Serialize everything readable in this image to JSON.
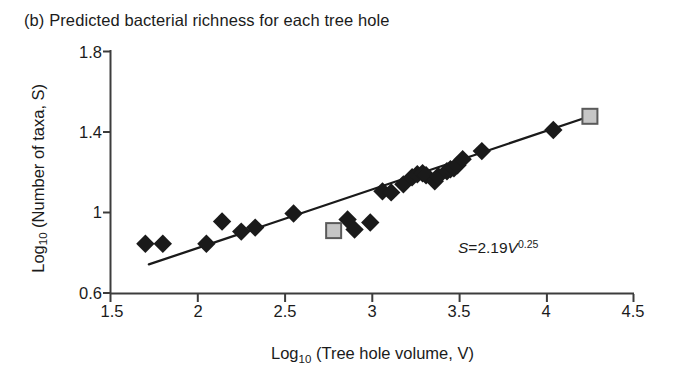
{
  "panel": {
    "label": "(b)",
    "title": "(b) Predicted bacterial richness for each tree hole"
  },
  "axes": {
    "y_title_main": "Log",
    "y_title_sub": "10",
    "y_title_rest": " (Number of taxa, S)",
    "x_title_main": "Log",
    "x_title_sub": "10",
    "x_title_rest": " (Tree hole volume, V)"
  },
  "annotation": {
    "eq_lhs": "S",
    "eq_eq": "=",
    "eq_coefficient": "2.19",
    "eq_var": "V",
    "eq_exponent": "0.25",
    "eq_full": "S = 2.19 V^0.25"
  },
  "colors": {
    "axis": "#3c3c3c",
    "text": "#1b1b1b",
    "diamond_fill": "#1a1a1a",
    "square_fill": "#c6c6c6",
    "square_stroke": "#5a5a5a",
    "trendline": "#1a1a1a",
    "background": "#ffffff"
  },
  "chart_data": {
    "type": "scatter",
    "title": "(b) Predicted bacterial richness for each tree hole",
    "xlabel": "Log10 (Tree hole volume, V)",
    "ylabel": "Log10 (Number of taxa, S)",
    "xlim": [
      1.5,
      4.5
    ],
    "ylim": [
      0.6,
      1.8
    ],
    "xticks": [
      "1.5",
      "2",
      "2.5",
      "3",
      "3.5",
      "4",
      "4.5"
    ],
    "xtick_values": [
      1.5,
      2,
      2.5,
      3,
      3.5,
      4,
      4.5
    ],
    "yticks": [
      "0.6",
      "1",
      "1.4",
      "1.8"
    ],
    "ytick_values": [
      0.6,
      1.0,
      1.4,
      1.8
    ],
    "grid": false,
    "legend": null,
    "series": [
      {
        "name": "Tree holes (observed)",
        "marker": "diamond",
        "color": "#1a1a1a",
        "points": [
          [
            1.7,
            0.845
          ],
          [
            1.8,
            0.845
          ],
          [
            2.05,
            0.845
          ],
          [
            2.14,
            0.955
          ],
          [
            2.25,
            0.905
          ],
          [
            2.33,
            0.925
          ],
          [
            2.55,
            0.995
          ],
          [
            2.86,
            0.965
          ],
          [
            2.9,
            0.915
          ],
          [
            2.99,
            0.95
          ],
          [
            3.06,
            1.105
          ],
          [
            3.11,
            1.1
          ],
          [
            3.18,
            1.14
          ],
          [
            3.23,
            1.175
          ],
          [
            3.26,
            1.19
          ],
          [
            3.29,
            1.195
          ],
          [
            3.31,
            1.185
          ],
          [
            3.36,
            1.155
          ],
          [
            3.38,
            1.18
          ],
          [
            3.43,
            1.205
          ],
          [
            3.45,
            1.215
          ],
          [
            3.47,
            1.22
          ],
          [
            3.49,
            1.235
          ],
          [
            3.52,
            1.265
          ],
          [
            3.63,
            1.305
          ],
          [
            4.04,
            1.41
          ]
        ]
      },
      {
        "name": "Highlighted tree holes",
        "marker": "square",
        "color": "#c6c6c6",
        "points": [
          [
            2.78,
            0.91
          ],
          [
            4.25,
            1.478
          ]
        ]
      }
    ],
    "fit_line": {
      "name": "Power-law fit",
      "equation": "S = 2.19 V^0.25",
      "slope": 0.25,
      "intercept": 0.34,
      "x_start": 1.72,
      "x_end": 4.28,
      "y_start": 0.742,
      "y_end": 1.487
    }
  }
}
